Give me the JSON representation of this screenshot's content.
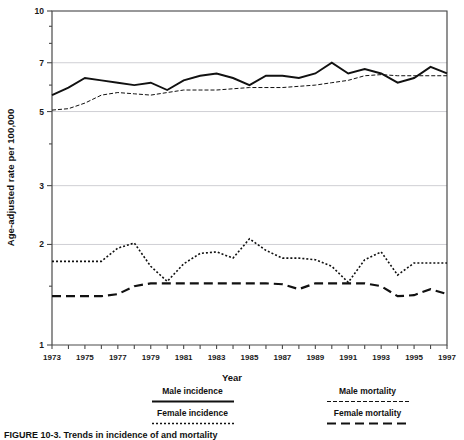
{
  "figure": {
    "caption": "FIGURE 10-3.  Trends in incidence of and mortality"
  },
  "legend": {
    "position": "below-axis",
    "items": [
      {
        "label": "Male incidence",
        "style": "solid"
      },
      {
        "label": "Male mortality",
        "style": "fine-dash"
      },
      {
        "label": "Female incidence",
        "style": "dotted"
      },
      {
        "label": "Female mortality",
        "style": "long-dash"
      }
    ]
  },
  "chart_data": {
    "type": "line",
    "title": "",
    "xlabel": "Year",
    "ylabel": "Age-adjusted rate per 100,000",
    "yscale": "log",
    "ylim": [
      1,
      10
    ],
    "ytick_values": [
      1,
      2,
      3,
      5,
      7,
      10
    ],
    "ytick_labels": [
      "1",
      "2",
      "3",
      "5",
      "7",
      "10"
    ],
    "yminor_ticks": [
      1.5,
      4,
      6,
      8,
      9
    ],
    "grid": "horizontal-major",
    "xlim": [
      1973,
      1997
    ],
    "x": [
      1973,
      1974,
      1975,
      1976,
      1977,
      1978,
      1979,
      1980,
      1981,
      1982,
      1983,
      1984,
      1985,
      1986,
      1987,
      1988,
      1989,
      1990,
      1991,
      1992,
      1993,
      1994,
      1995,
      1996,
      1997
    ],
    "xtick_labels": [
      "1973",
      "1975",
      "1977",
      "1979",
      "1981",
      "1983",
      "1985",
      "1987",
      "1989",
      "1991",
      "1993",
      "1995",
      "1997"
    ],
    "series": [
      {
        "name": "Male incidence",
        "style": "solid",
        "values": [
          5.6,
          5.9,
          6.3,
          6.2,
          6.1,
          6.0,
          6.1,
          5.8,
          6.2,
          6.4,
          6.5,
          6.3,
          6.0,
          6.4,
          6.4,
          6.3,
          6.5,
          7.0,
          6.5,
          6.7,
          6.5,
          6.1,
          6.3,
          6.8,
          6.5
        ]
      },
      {
        "name": "Male mortality",
        "style": "fine-dash",
        "values": [
          5.05,
          5.1,
          5.3,
          5.6,
          5.7,
          5.65,
          5.6,
          5.7,
          5.8,
          5.8,
          5.8,
          5.85,
          5.9,
          5.9,
          5.9,
          5.95,
          6.0,
          6.1,
          6.2,
          6.4,
          6.45,
          6.4,
          6.4,
          6.4,
          6.4
        ]
      },
      {
        "name": "Female incidence",
        "style": "dotted",
        "values": [
          1.78,
          1.78,
          1.78,
          1.78,
          1.95,
          2.02,
          1.72,
          1.55,
          1.75,
          1.88,
          1.9,
          1.82,
          2.08,
          1.92,
          1.82,
          1.82,
          1.8,
          1.72,
          1.54,
          1.8,
          1.9,
          1.62,
          1.76,
          1.76,
          1.76
        ]
      },
      {
        "name": "Female mortality",
        "style": "long-dash",
        "values": [
          1.4,
          1.4,
          1.4,
          1.4,
          1.42,
          1.5,
          1.53,
          1.53,
          1.53,
          1.53,
          1.53,
          1.53,
          1.53,
          1.53,
          1.52,
          1.47,
          1.53,
          1.53,
          1.53,
          1.53,
          1.5,
          1.4,
          1.41,
          1.47,
          1.42
        ]
      }
    ]
  }
}
